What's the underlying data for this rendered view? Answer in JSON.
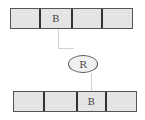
{
  "top_bar": {
    "cells": [
      "",
      "B",
      "",
      ""
    ],
    "widths": [
      30,
      33,
      31,
      29
    ]
  },
  "bottom_bar": {
    "cells": [
      "",
      "",
      "B",
      ""
    ],
    "widths": [
      31,
      34,
      29,
      30
    ]
  },
  "register": {
    "label": "R"
  }
}
